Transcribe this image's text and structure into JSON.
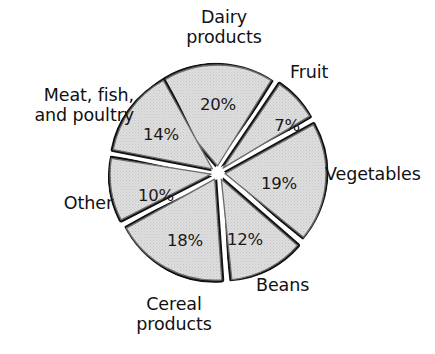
{
  "figure": {
    "background_color": "#ffffff",
    "slice_fill_color": "#d9d9d9",
    "slice_outline_color": "#6b6b6b",
    "slice_shadow_color": "#111111",
    "text_color": "#111111"
  },
  "chart_data": {
    "type": "pie",
    "title": "",
    "subtitle": "",
    "xlabel": "",
    "ylabel": "",
    "exploded": true,
    "grid": false,
    "legend_position": "around-slices",
    "value_unit": "percent",
    "total": 100,
    "categories": [
      "Dairy products",
      "Fruit",
      "Vegetables",
      "Beans",
      "Cereal products",
      "Other",
      "Meat, fish, and poultry"
    ],
    "values": [
      20,
      7,
      19,
      12,
      18,
      10,
      14
    ],
    "value_labels": [
      "20%",
      "7%",
      "19%",
      "12%",
      "18%",
      "10%",
      "14%"
    ],
    "slices": [
      {
        "label": "Dairy products",
        "label_line1": "Dairy",
        "label_line2": "products",
        "value": 20,
        "value_label": "20%",
        "start_angle_deg": -40,
        "end_angle_deg": 32,
        "explode_dir_deg": -4
      },
      {
        "label": "Fruit",
        "label_line1": "Fruit",
        "label_line2": "",
        "value": 7,
        "value_label": "7%",
        "start_angle_deg": 34,
        "end_angle_deg": 59,
        "explode_dir_deg": 46
      },
      {
        "label": "Vegetables",
        "label_line1": "Vegetables",
        "label_line2": "",
        "value": 19,
        "value_label": "19%",
        "start_angle_deg": 61,
        "end_angle_deg": 129,
        "explode_dir_deg": 95
      },
      {
        "label": "Beans",
        "label_line1": "Beans",
        "label_line2": "",
        "value": 12,
        "value_label": "12%",
        "start_angle_deg": 131,
        "end_angle_deg": 174,
        "explode_dir_deg": 152
      },
      {
        "label": "Cereal products",
        "label_line1": "Cereal",
        "label_line2": "products",
        "value": 18,
        "value_label": "18%",
        "start_angle_deg": 176,
        "end_angle_deg": 241,
        "explode_dir_deg": 208
      },
      {
        "label": "Other",
        "label_line1": "Other",
        "label_line2": "",
        "value": 10,
        "value_label": "10%",
        "start_angle_deg": 243,
        "end_angle_deg": 279,
        "explode_dir_deg": 261
      },
      {
        "label": "Meat, fish, and poultry",
        "label_line1": "Meat, fish,",
        "label_line2": "and poultry",
        "value": 14,
        "value_label": "14%",
        "start_angle_deg": 281,
        "end_angle_deg": 331,
        "explode_dir_deg": 306
      }
    ]
  }
}
